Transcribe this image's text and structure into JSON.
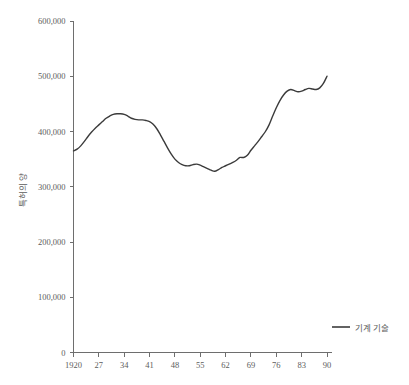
{
  "chart_data": {
    "type": "line",
    "title": "",
    "subtitle": "",
    "xlabel": "",
    "ylabel": "특허의 양",
    "xlim": [
      1920,
      1990
    ],
    "ylim": [
      0,
      600000
    ],
    "grid": false,
    "legend_position": "bottom-right",
    "y_ticks": [
      0,
      100000,
      200000,
      300000,
      400000,
      500000,
      600000
    ],
    "y_tick_labels": [
      "0",
      "100,000",
      "200,000",
      "300,000",
      "400,000",
      "500,000",
      "600,000"
    ],
    "x_ticks": [
      1920,
      1927,
      1934,
      1941,
      1948,
      1955,
      1962,
      1969,
      1976,
      1983,
      1990
    ],
    "x_tick_labels": [
      "1920",
      "27",
      "34",
      "41",
      "48",
      "55",
      "62",
      "69",
      "76",
      "83",
      "90"
    ],
    "series": [
      {
        "name": "기계 기술",
        "color": "#3b3b3b",
        "x": [
          1920,
          1921,
          1922,
          1923,
          1924,
          1925,
          1926,
          1927,
          1928,
          1929,
          1930,
          1931,
          1932,
          1933,
          1934,
          1935,
          1936,
          1937,
          1938,
          1939,
          1940,
          1941,
          1942,
          1943,
          1944,
          1945,
          1946,
          1947,
          1948,
          1949,
          1950,
          1951,
          1952,
          1953,
          1954,
          1955,
          1956,
          1957,
          1958,
          1959,
          1960,
          1961,
          1962,
          1963,
          1964,
          1965,
          1966,
          1967,
          1968,
          1969,
          1970,
          1971,
          1972,
          1973,
          1974,
          1975,
          1976,
          1977,
          1978,
          1979,
          1980,
          1981,
          1982,
          1983,
          1984,
          1985,
          1986,
          1987,
          1988,
          1989,
          1990
        ],
        "values": [
          365000,
          368000,
          374000,
          382000,
          391000,
          399000,
          406000,
          412000,
          418000,
          424000,
          428000,
          431000,
          432000,
          432000,
          431000,
          428000,
          424000,
          422000,
          421000,
          421000,
          420000,
          418000,
          413000,
          405000,
          394000,
          382000,
          370000,
          359000,
          350000,
          344000,
          340000,
          338000,
          338000,
          340000,
          341000,
          339000,
          336000,
          333000,
          330000,
          328000,
          331000,
          335000,
          338000,
          341000,
          344000,
          348000,
          353000,
          353000,
          357000,
          366000,
          374000,
          382000,
          391000,
          400000,
          412000,
          428000,
          443000,
          456000,
          466000,
          473000,
          476000,
          474000,
          472000,
          473000,
          476000,
          478000,
          477000,
          476000,
          479000,
          487000,
          500000
        ]
      }
    ],
    "annotations": []
  },
  "legend": {
    "items": [
      {
        "label": "기계 기술",
        "color": "#3b3b3b"
      }
    ]
  },
  "axes": {
    "y_title": "특허의 양",
    "x_title": ""
  },
  "colors": {
    "axis": "#6e6e6e",
    "text": "#5c5c5c",
    "series": "#3b3b3b",
    "background": "#ffffff"
  }
}
